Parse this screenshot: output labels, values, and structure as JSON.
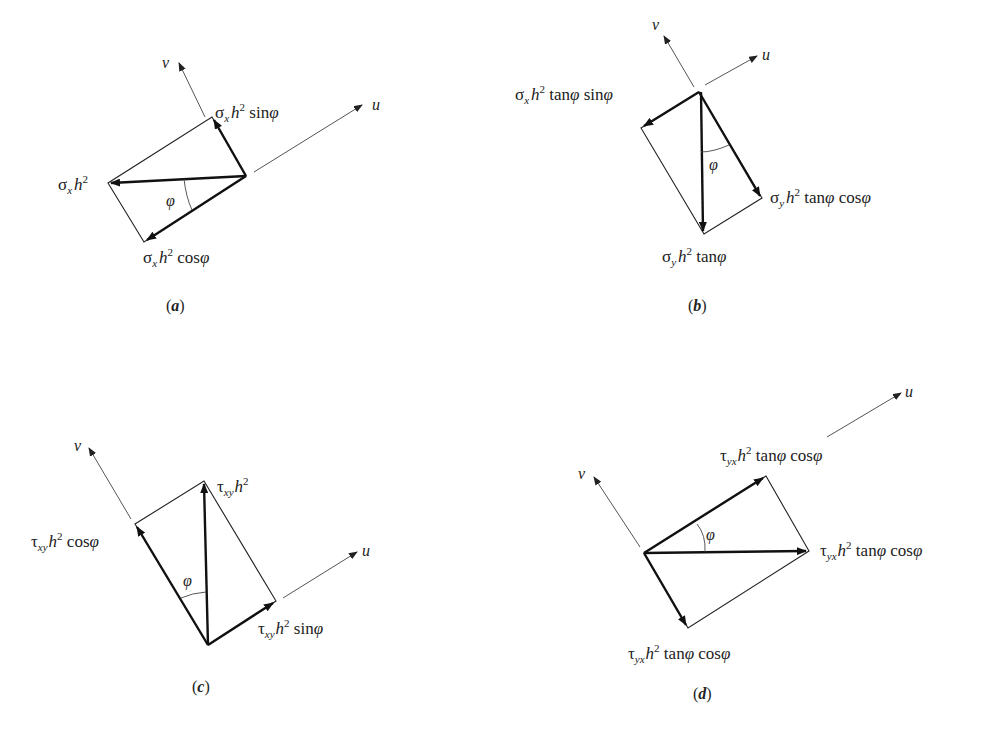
{
  "figure": {
    "panels": [
      {
        "id": "a",
        "caption": "(a)",
        "axes": {
          "v": "v",
          "u": "u"
        },
        "angle_label": "φ",
        "labels": {
          "top": "σx h² sin φ",
          "left": "σx h²",
          "bottom": "σx h² cos φ"
        }
      },
      {
        "id": "b",
        "caption": "(b)",
        "axes": {
          "v": "v",
          "u": "u"
        },
        "angle_label": "φ",
        "labels": {
          "left": "σx h² tan φ sin φ",
          "right": "σy h² tan φ cos φ",
          "bottom": "σy h² tan φ"
        }
      },
      {
        "id": "c",
        "caption": "(c)",
        "axes": {
          "v": "v",
          "u": "u"
        },
        "angle_label": "φ",
        "labels": {
          "top": "τxy h²",
          "left": "τxy h² cos φ",
          "right": "τxy h² sin φ"
        }
      },
      {
        "id": "d",
        "caption": "(d)",
        "axes": {
          "v": "v",
          "u": "u"
        },
        "angle_label": "φ",
        "labels": {
          "top": "τyx h² tan φ cos φ",
          "right": "τyx h² tan φ cos φ",
          "bottom": "τyx h² tan φ cos φ"
        }
      }
    ]
  },
  "text": {
    "a": {
      "sigma": "σ",
      "x": "x",
      "h": "h",
      "sq": "2",
      "sin": " sin",
      "cos": " cos",
      "phi": "φ",
      "v": "v",
      "u": "u",
      "cap_l": "(",
      "cap_c": "a",
      "cap_r": ")"
    },
    "b": {
      "sigma": "σ",
      "x": "x",
      "y": "y",
      "h": "h",
      "sq": "2",
      "tan": " tan",
      "sin": " sin",
      "cos": " cos",
      "phi": "φ",
      "v": "v",
      "u": "u",
      "cap_l": "(",
      "cap_c": "b",
      "cap_r": ")"
    },
    "c": {
      "tau": "τ",
      "xy": "xy",
      "h": "h",
      "sq": "2",
      "sin": " sin",
      "cos": " cos",
      "phi": "φ",
      "v": "v",
      "u": "u",
      "cap_l": "(",
      "cap_c": "c",
      "cap_r": ")"
    },
    "d": {
      "tau": "τ",
      "yx": "yx",
      "h": "h",
      "sq": "2",
      "tan": " tan",
      "cos": " cos",
      "phi": "φ",
      "v": "v",
      "u": "u",
      "cap_l": "(",
      "cap_c": "d",
      "cap_r": ")"
    }
  }
}
